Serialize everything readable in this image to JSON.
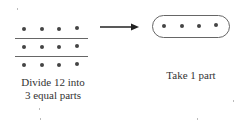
{
  "left_group": {
    "rows": 3,
    "cols": 4,
    "total": 12,
    "dot_color": "#444444",
    "divider_color": "#666666",
    "caption_line1": "Divide 12 into",
    "caption_line2": "3 equal parts"
  },
  "arrow": {
    "direction": "right",
    "color": "#222222"
  },
  "right_group": {
    "dots": 4,
    "container": "rounded-pill",
    "caption": "Take 1 part"
  }
}
